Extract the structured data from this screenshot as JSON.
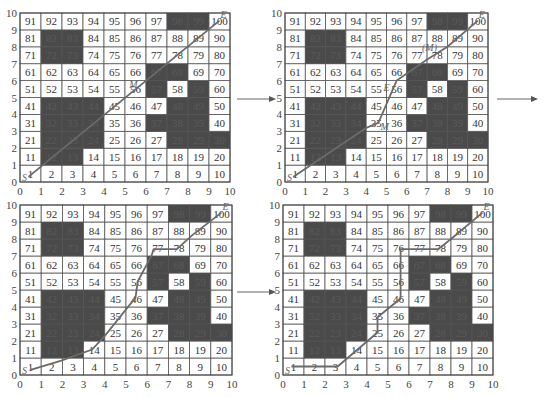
{
  "figure": {
    "grid": {
      "rows": 10,
      "cols": 10,
      "cell_numbers_start": 1,
      "cell_numbers_end": 100
    },
    "obstacles": [
      12,
      13,
      22,
      23,
      24,
      28,
      29,
      30,
      32,
      33,
      34,
      37,
      38,
      39,
      42,
      43,
      44,
      48,
      49,
      57,
      59,
      67,
      68,
      72,
      73,
      82,
      83,
      98,
      99
    ],
    "axis_ticks": [
      "0",
      "1",
      "2",
      "3",
      "4",
      "5",
      "6",
      "7",
      "8",
      "9",
      "10"
    ],
    "colors": {
      "obstacle": "#4a4a4a",
      "free": "#ffffff",
      "grid_line": "#555555",
      "path": "#6a6a6a"
    },
    "panels": [
      {
        "id": "panel-1",
        "start_label": "S",
        "end_label": "E",
        "mid_labels": [
          {
            "text": "M",
            "x": 5.2,
            "y": 5.55
          }
        ],
        "path": [
          [
            0.4,
            0.3
          ],
          [
            9.5,
            9.55
          ]
        ]
      },
      {
        "id": "panel-2",
        "start_label": "S",
        "end_label": "E",
        "mid_labels": [
          {
            "text": "M",
            "x": 4.7,
            "y": 3.05
          },
          {
            "text": "E",
            "x": 4.85,
            "y": 5.4
          },
          {
            "text": "(M)",
            "x": 6.75,
            "y": 7.75
          }
        ],
        "path": [
          [
            0.4,
            0.3
          ],
          [
            4.0,
            3.2
          ],
          [
            4.6,
            3.5
          ],
          [
            5.5,
            6.0
          ],
          [
            7.0,
            7.25
          ],
          [
            8.0,
            8.0
          ],
          [
            9.5,
            9.55
          ]
        ]
      },
      {
        "id": "panel-3",
        "start_label": "S",
        "end_label": "E",
        "mid_labels": [],
        "path": [
          [
            0.5,
            0.3
          ],
          [
            1.95,
            0.85
          ],
          [
            3.4,
            1.5
          ],
          [
            4.0,
            2.3
          ],
          [
            5.45,
            4.55
          ],
          [
            5.55,
            5.5
          ],
          [
            6.2,
            7.0
          ],
          [
            6.3,
            7.4
          ],
          [
            7.4,
            7.4
          ],
          [
            8.1,
            8.2
          ],
          [
            9.5,
            9.55
          ]
        ]
      },
      {
        "id": "panel-4",
        "start_label": "S",
        "end_label": "E",
        "mid_labels": [],
        "path": [
          [
            0.4,
            0.5
          ],
          [
            2.6,
            0.5
          ],
          [
            4.5,
            2.5
          ],
          [
            4.5,
            3.4
          ],
          [
            5.6,
            4.5
          ],
          [
            5.6,
            7.4
          ],
          [
            7.4,
            7.4
          ],
          [
            8.1,
            8.1
          ],
          [
            9.5,
            9.55
          ]
        ]
      }
    ],
    "arrows": [
      {
        "id": "arrow-1-to-2",
        "from": "panel-1",
        "to": "panel-2"
      },
      {
        "id": "arrow-2-to-next",
        "from": "panel-2",
        "to": "panel-3"
      },
      {
        "id": "arrow-3-to-4",
        "from": "panel-3",
        "to": "panel-4"
      }
    ]
  }
}
